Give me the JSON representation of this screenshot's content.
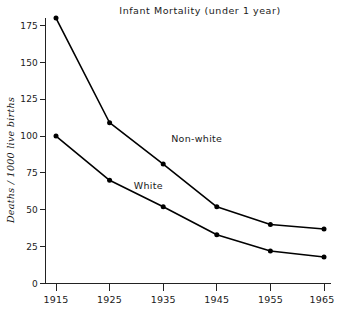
{
  "chart_data": {
    "type": "line",
    "title": "Infant  Mortality  (under 1 year)",
    "xlabel": "",
    "ylabel": "Deaths / 1000 live births",
    "categories": [
      "1915",
      "1925",
      "1935",
      "1945",
      "1955",
      "1965"
    ],
    "x": [
      1915,
      1925,
      1935,
      1945,
      1955,
      1965
    ],
    "xlim": [
      1915,
      1965
    ],
    "ylim": [
      0,
      180
    ],
    "yticks": [
      0,
      25,
      50,
      75,
      100,
      125,
      150,
      175
    ],
    "ytick_labels": [
      "0",
      "25",
      "50",
      "75",
      "100",
      "125",
      "150",
      "175"
    ],
    "grid": false,
    "legend": "inline-annotations",
    "series": [
      {
        "name": "Non-white",
        "values": [
          180,
          109,
          81,
          52,
          40,
          37
        ],
        "color": "#000000",
        "marker": "filled-circle",
        "label_x": 1936.5,
        "label_y": 96
      },
      {
        "name": "White",
        "values": [
          100,
          70,
          52,
          33,
          22,
          18
        ],
        "color": "#000000",
        "marker": "filled-circle",
        "label_x": 1929.5,
        "label_y": 64
      }
    ],
    "annotations": [
      {
        "text": "Non-white",
        "kind": "series-label"
      },
      {
        "text": "White",
        "kind": "series-label"
      }
    ]
  },
  "figure": {
    "background": "#ffffff",
    "axis_color": "#222222",
    "line_color": "#000000"
  }
}
